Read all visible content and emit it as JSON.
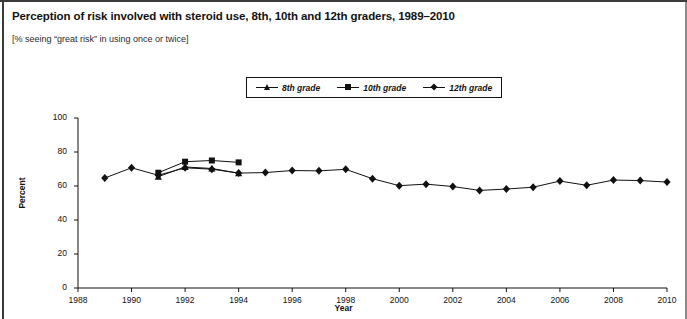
{
  "figure": {
    "title": "Perception of risk involved with steroid use, 8th, 10th and 12th graders, 1989–2010",
    "subtitle": "[% seeing “great risk” in using once or twice]"
  },
  "legend": {
    "position": "top-center",
    "items": [
      {
        "label": "8th grade",
        "marker": "triangle-marker",
        "color": "#111111"
      },
      {
        "label": "10th grade",
        "marker": "square-marker",
        "color": "#111111"
      },
      {
        "label": "12th grade",
        "marker": "diamond-marker",
        "color": "#111111"
      }
    ]
  },
  "axes": {
    "ylabel": "Percent",
    "xlabel": "Year",
    "yticks": [
      "0",
      "20",
      "40",
      "60",
      "80",
      "100"
    ],
    "xticks": [
      "1988",
      "1990",
      "1992",
      "1994",
      "1996",
      "1998",
      "2000",
      "2002",
      "2004",
      "2006",
      "2008",
      "2010"
    ]
  },
  "chart_data": {
    "type": "line",
    "title": "Perception of risk involved with steroid use, 8th, 10th and 12th graders, 1989–2010",
    "subtitle": "[% seeing “great risk” in using once or twice]",
    "xlabel": "Year",
    "ylabel": "Percent",
    "xlim": [
      1988,
      2010
    ],
    "ylim": [
      0,
      100
    ],
    "ytick_step": 20,
    "xtick_step": 2,
    "grid": false,
    "legend_position": "top-center",
    "series": [
      {
        "name": "8th grade",
        "marker": "triangle",
        "color": "#111111",
        "x": [
          1991,
          1992,
          1993,
          1994
        ],
        "values": [
          65.5,
          71.2,
          70.3,
          67.5
        ]
      },
      {
        "name": "10th grade",
        "marker": "square",
        "color": "#111111",
        "x": [
          1991,
          1992,
          1993,
          1994
        ],
        "values": [
          67.8,
          74.3,
          75.0,
          73.9
        ]
      },
      {
        "name": "12th grade",
        "marker": "diamond",
        "color": "#111111",
        "x": [
          1989,
          1990,
          1991,
          1992,
          1993,
          1994,
          1995,
          1996,
          1997,
          1998,
          1999,
          2000,
          2001,
          2002,
          2003,
          2004,
          2005,
          2006,
          2007,
          2008,
          2009,
          2010
        ],
        "values": [
          64.7,
          70.7,
          66.3,
          70.7,
          69.9,
          67.6,
          67.9,
          69.1,
          68.9,
          69.8,
          64.3,
          60.2,
          61.1,
          59.7,
          57.4,
          58.2,
          59.3,
          62.9,
          60.4,
          63.5,
          63.2,
          62.3
        ]
      }
    ]
  }
}
